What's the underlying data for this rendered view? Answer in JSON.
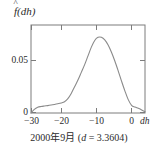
{
  "chart_data": {
    "type": "line",
    "title": "",
    "subtitle": "",
    "ylabel": "f(dh)",
    "ylabel_parts": {
      "fhat": "f",
      "paren_open": "(",
      "arg": "dh",
      "paren_close": ")"
    },
    "xlabel": "dh",
    "xlim": [
      -30,
      4
    ],
    "ylim": [
      0,
      0.0855
    ],
    "xticks": [
      -30,
      -20,
      -10,
      0
    ],
    "xticklabels": [
      "−30",
      "−20",
      "−10",
      "0"
    ],
    "yticks": [
      0,
      0.05
    ],
    "yticklabels": [
      "0",
      "0.05"
    ],
    "grid": false,
    "legend": null,
    "ticks_all_sides": true,
    "line_color": "#8a8a8a",
    "axis_color": "#7c7c7c",
    "series": [
      {
        "name": "kernel density estimate",
        "x": [
          -30,
          -29,
          -28,
          -27,
          -26,
          -25,
          -24,
          -23,
          -22,
          -21,
          -20,
          -19,
          -18,
          -17,
          -16,
          -15,
          -14,
          -13,
          -12,
          -11,
          -10,
          -9,
          -8,
          -7,
          -6,
          -5,
          -4,
          -3,
          -2,
          -1,
          0,
          1,
          2,
          3,
          4
        ],
        "y": [
          0.0,
          0.0035,
          0.0055,
          0.0063,
          0.0068,
          0.0072,
          0.0077,
          0.0083,
          0.009,
          0.0098,
          0.011,
          0.014,
          0.019,
          0.0255,
          0.032,
          0.0395,
          0.047,
          0.0555,
          0.064,
          0.0705,
          0.0735,
          0.0735,
          0.071,
          0.066,
          0.059,
          0.0505,
          0.041,
          0.031,
          0.0215,
          0.013,
          0.0075,
          0.0058,
          0.0045,
          0.003,
          0.0012
        ]
      }
    ]
  },
  "caption": {
    "year": "2000",
    "year_unit": "年",
    "month": "9",
    "month_unit": "月",
    "paren_open": "(",
    "param": "d",
    "equals": " = ",
    "value": "3.3604",
    "paren_close": ")",
    "full": "2000年9月 (d = 3.3604)"
  }
}
